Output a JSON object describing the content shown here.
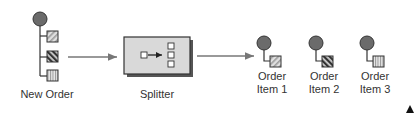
{
  "diagram": {
    "title": "Splitter",
    "nodes": {
      "new_order": {
        "label": "New Order"
      },
      "splitter": {
        "label": "Splitter"
      },
      "items": [
        {
          "line1": "Order",
          "line2": "Item 1",
          "pattern": "diagonal-light"
        },
        {
          "line1": "Order",
          "line2": "Item 2",
          "pattern": "diagonal-dark"
        },
        {
          "line1": "Order",
          "line2": "Item 3",
          "pattern": "vertical-stripes"
        }
      ]
    },
    "colors": {
      "circle": "#6b6b6b",
      "box_fill": "#d9d9d9",
      "stroke": "#333333",
      "arrow": "#777777"
    }
  }
}
